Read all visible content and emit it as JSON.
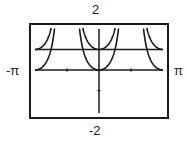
{
  "chart_data": {
    "type": "line",
    "title": "",
    "xlabel": "",
    "ylabel": "",
    "xlim": [
      -3.14159,
      3.14159
    ],
    "ylim": [
      -2,
      2
    ],
    "x_tick_labels": {
      "min": "-π",
      "max": "π"
    },
    "y_tick_labels": {
      "min": "-2",
      "max": "2"
    },
    "x_ticks": [
      -1.5708,
      1.5708
    ],
    "y_ticks": [
      -1
    ],
    "grid": false,
    "legend": null,
    "series": [
      {
        "name": "y = tan²(x)",
        "function": "tan2",
        "color": "#1a1a1a"
      },
      {
        "name": "y = sec²(x)",
        "function": "sec2",
        "color": "#1a1a1a"
      },
      {
        "name": "y = 1",
        "function": "const1",
        "color": "#1a1a1a"
      }
    ]
  },
  "window": {
    "xmin_label": "-π",
    "xmax_label": "π",
    "ymin_label": "-2",
    "ymax_label": "2"
  }
}
